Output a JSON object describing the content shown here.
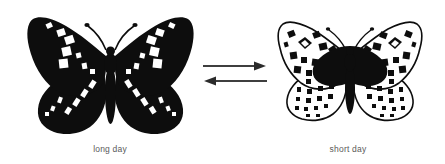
{
  "figure": {
    "background_color": "#ffffff",
    "ink_color": "#0d0d0d",
    "caption_color": "#5a5a5a",
    "arrow_color": "#2b2b2b"
  },
  "specimens": [
    {
      "name": "long-day-form",
      "caption": "long day",
      "morph": "dark",
      "wing_ground_color": "#0d0d0d",
      "wing_marking_color": "#ffffff",
      "marking_style": "white-bands"
    },
    {
      "name": "short-day-form",
      "caption": "short day",
      "morph": "light",
      "wing_ground_color": "#ffffff",
      "wing_marking_color": "#0d0d0d",
      "marking_style": "black-spots"
    }
  ],
  "arrows": [
    {
      "name": "arrow-long-to-short",
      "direction": "right"
    },
    {
      "name": "arrow-short-to-long",
      "direction": "left"
    }
  ]
}
